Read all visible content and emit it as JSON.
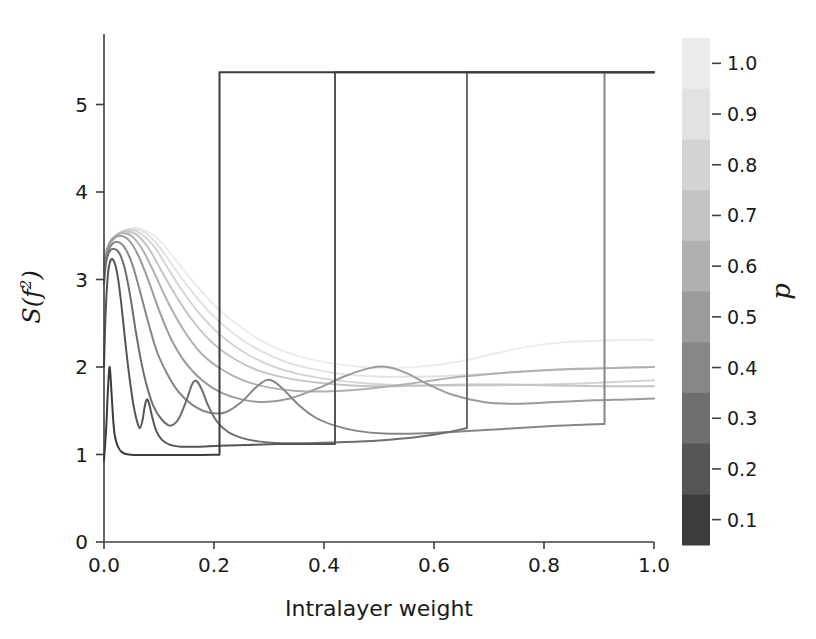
{
  "figure": {
    "background": "#ffffff",
    "axis_color": "#3f3f3f",
    "text_color": "#1a1a1a"
  },
  "chart_data": {
    "type": "line",
    "title": "",
    "xlabel": "Intralayer weight",
    "ylabel": "S(f²)",
    "ylabel_parts": {
      "main": "S(f",
      "sup": "2",
      "tail": ")"
    },
    "xlim": [
      0.0,
      1.0
    ],
    "ylim": [
      0.0,
      5.6
    ],
    "xticks": [
      0.0,
      0.2,
      0.4,
      0.6,
      0.8,
      1.0
    ],
    "xticklabels": [
      "0.0",
      "0.2",
      "0.4",
      "0.6",
      "0.8",
      "1.0"
    ],
    "yticks": [
      0,
      1,
      2,
      3,
      4,
      5
    ],
    "yticklabels": [
      "0",
      "1",
      "2",
      "3",
      "4",
      "5"
    ],
    "grid": false,
    "legend": "colorbar-right",
    "plateau_value": 5.37,
    "series": [
      {
        "name": "p = 0.1",
        "p": 0.1,
        "color": "#3c3c3c",
        "linewidth": 2.0,
        "points": [
          [
            0.0,
            0.93
          ],
          [
            0.004,
            1.3
          ],
          [
            0.007,
            1.72
          ],
          [
            0.01,
            2.0
          ],
          [
            0.013,
            1.78
          ],
          [
            0.016,
            1.46
          ],
          [
            0.019,
            1.24
          ],
          [
            0.023,
            1.13
          ],
          [
            0.027,
            1.07
          ],
          [
            0.032,
            1.03
          ],
          [
            0.04,
            1.005
          ],
          [
            0.055,
            0.995
          ],
          [
            0.07,
            0.993
          ],
          [
            0.09,
            0.993
          ],
          [
            0.12,
            0.994
          ],
          [
            0.16,
            0.995
          ],
          [
            0.2,
            0.997
          ],
          [
            0.209,
            0.998
          ]
        ],
        "jump_x": 0.21,
        "jump_to": 5.37,
        "plateau_to_x": 1.0
      },
      {
        "name": "p = 0.2",
        "p": 0.2,
        "color": "#555555",
        "linewidth": 2.0,
        "points": [
          [
            0.0,
            2.0
          ],
          [
            0.003,
            2.62
          ],
          [
            0.007,
            3.05
          ],
          [
            0.012,
            3.22
          ],
          [
            0.018,
            3.21
          ],
          [
            0.024,
            3.07
          ],
          [
            0.03,
            2.8
          ],
          [
            0.036,
            2.45
          ],
          [
            0.042,
            2.1
          ],
          [
            0.048,
            1.8
          ],
          [
            0.054,
            1.55
          ],
          [
            0.06,
            1.38
          ],
          [
            0.065,
            1.3
          ],
          [
            0.07,
            1.39
          ],
          [
            0.074,
            1.55
          ],
          [
            0.078,
            1.63
          ],
          [
            0.082,
            1.58
          ],
          [
            0.088,
            1.42
          ],
          [
            0.095,
            1.27
          ],
          [
            0.105,
            1.17
          ],
          [
            0.12,
            1.11
          ],
          [
            0.14,
            1.09
          ],
          [
            0.17,
            1.09
          ],
          [
            0.21,
            1.1
          ],
          [
            0.26,
            1.11
          ],
          [
            0.32,
            1.12
          ],
          [
            0.38,
            1.12
          ],
          [
            0.418,
            1.12
          ]
        ],
        "jump_x": 0.42,
        "jump_to": 5.37,
        "plateau_to_x": 1.0
      },
      {
        "name": "p = 0.3",
        "p": 0.3,
        "color": "#6e6e6e",
        "linewidth": 2.0,
        "points": [
          [
            0.0,
            2.95
          ],
          [
            0.004,
            3.2
          ],
          [
            0.01,
            3.32
          ],
          [
            0.018,
            3.35
          ],
          [
            0.028,
            3.3
          ],
          [
            0.038,
            3.12
          ],
          [
            0.048,
            2.8
          ],
          [
            0.058,
            2.4
          ],
          [
            0.068,
            2.05
          ],
          [
            0.078,
            1.78
          ],
          [
            0.09,
            1.55
          ],
          [
            0.105,
            1.4
          ],
          [
            0.12,
            1.33
          ],
          [
            0.135,
            1.4
          ],
          [
            0.15,
            1.62
          ],
          [
            0.16,
            1.8
          ],
          [
            0.168,
            1.84
          ],
          [
            0.178,
            1.74
          ],
          [
            0.19,
            1.55
          ],
          [
            0.205,
            1.38
          ],
          [
            0.225,
            1.26
          ],
          [
            0.25,
            1.19
          ],
          [
            0.28,
            1.15
          ],
          [
            0.32,
            1.13
          ],
          [
            0.37,
            1.13
          ],
          [
            0.43,
            1.14
          ],
          [
            0.5,
            1.16
          ],
          [
            0.57,
            1.2
          ],
          [
            0.63,
            1.26
          ],
          [
            0.658,
            1.3
          ]
        ],
        "jump_x": 0.66,
        "jump_to": 5.37,
        "plateau_to_x": 1.0
      },
      {
        "name": "p = 0.4",
        "p": 0.4,
        "color": "#868686",
        "linewidth": 2.0,
        "points": [
          [
            0.0,
            3.1
          ],
          [
            0.006,
            3.3
          ],
          [
            0.014,
            3.4
          ],
          [
            0.024,
            3.43
          ],
          [
            0.036,
            3.38
          ],
          [
            0.05,
            3.2
          ],
          [
            0.064,
            2.9
          ],
          [
            0.08,
            2.52
          ],
          [
            0.096,
            2.18
          ],
          [
            0.115,
            1.92
          ],
          [
            0.135,
            1.72
          ],
          [
            0.16,
            1.57
          ],
          [
            0.19,
            1.48
          ],
          [
            0.22,
            1.48
          ],
          [
            0.25,
            1.6
          ],
          [
            0.275,
            1.76
          ],
          [
            0.295,
            1.85
          ],
          [
            0.31,
            1.83
          ],
          [
            0.33,
            1.72
          ],
          [
            0.355,
            1.56
          ],
          [
            0.385,
            1.42
          ],
          [
            0.42,
            1.33
          ],
          [
            0.46,
            1.27
          ],
          [
            0.51,
            1.24
          ],
          [
            0.57,
            1.24
          ],
          [
            0.64,
            1.26
          ],
          [
            0.72,
            1.29
          ],
          [
            0.8,
            1.32
          ],
          [
            0.87,
            1.34
          ],
          [
            0.908,
            1.35
          ]
        ],
        "jump_x": 0.91,
        "jump_to": 5.37,
        "plateau_to_x": 1.0
      },
      {
        "name": "p = 0.5",
        "p": 0.5,
        "color": "#9b9b9b",
        "linewidth": 2.0,
        "points": [
          [
            0.0,
            3.18
          ],
          [
            0.008,
            3.38
          ],
          [
            0.018,
            3.47
          ],
          [
            0.03,
            3.5
          ],
          [
            0.045,
            3.45
          ],
          [
            0.062,
            3.28
          ],
          [
            0.08,
            3.0
          ],
          [
            0.1,
            2.65
          ],
          [
            0.122,
            2.32
          ],
          [
            0.148,
            2.05
          ],
          [
            0.178,
            1.85
          ],
          [
            0.212,
            1.71
          ],
          [
            0.25,
            1.63
          ],
          [
            0.292,
            1.6
          ],
          [
            0.338,
            1.64
          ],
          [
            0.39,
            1.76
          ],
          [
            0.44,
            1.9
          ],
          [
            0.485,
            1.99
          ],
          [
            0.515,
            2.0
          ],
          [
            0.55,
            1.93
          ],
          [
            0.59,
            1.8
          ],
          [
            0.635,
            1.68
          ],
          [
            0.69,
            1.6
          ],
          [
            0.75,
            1.58
          ],
          [
            0.82,
            1.6
          ],
          [
            0.89,
            1.62
          ],
          [
            0.95,
            1.63
          ],
          [
            1.0,
            1.64
          ]
        ],
        "jump_x": null
      },
      {
        "name": "p = 0.6",
        "p": 0.6,
        "color": "#b0b0b0",
        "linewidth": 2.0,
        "points": [
          [
            0.0,
            3.22
          ],
          [
            0.01,
            3.42
          ],
          [
            0.022,
            3.5
          ],
          [
            0.036,
            3.53
          ],
          [
            0.052,
            3.49
          ],
          [
            0.072,
            3.32
          ],
          [
            0.094,
            3.04
          ],
          [
            0.118,
            2.72
          ],
          [
            0.145,
            2.42
          ],
          [
            0.176,
            2.16
          ],
          [
            0.212,
            1.98
          ],
          [
            0.252,
            1.85
          ],
          [
            0.296,
            1.77
          ],
          [
            0.345,
            1.73
          ],
          [
            0.4,
            1.72
          ],
          [
            0.46,
            1.74
          ],
          [
            0.52,
            1.78
          ],
          [
            0.58,
            1.83
          ],
          [
            0.65,
            1.89
          ],
          [
            0.72,
            1.93
          ],
          [
            0.79,
            1.96
          ],
          [
            0.86,
            1.98
          ],
          [
            0.93,
            1.99
          ],
          [
            1.0,
            2.0
          ]
        ],
        "jump_x": null
      },
      {
        "name": "p = 0.7",
        "p": 0.7,
        "color": "#c4c4c4",
        "linewidth": 2.0,
        "points": [
          [
            0.0,
            3.25
          ],
          [
            0.012,
            3.44
          ],
          [
            0.026,
            3.52
          ],
          [
            0.042,
            3.55
          ],
          [
            0.06,
            3.51
          ],
          [
            0.082,
            3.35
          ],
          [
            0.106,
            3.08
          ],
          [
            0.134,
            2.78
          ],
          [
            0.165,
            2.5
          ],
          [
            0.2,
            2.26
          ],
          [
            0.24,
            2.08
          ],
          [
            0.285,
            1.95
          ],
          [
            0.335,
            1.87
          ],
          [
            0.39,
            1.82
          ],
          [
            0.45,
            1.79
          ],
          [
            0.515,
            1.78
          ],
          [
            0.585,
            1.79
          ],
          [
            0.66,
            1.8
          ],
          [
            0.735,
            1.8
          ],
          [
            0.82,
            1.79
          ],
          [
            0.91,
            1.78
          ],
          [
            1.0,
            1.78
          ]
        ],
        "jump_x": null
      },
      {
        "name": "p = 0.8",
        "p": 0.8,
        "color": "#d4d4d4",
        "linewidth": 2.0,
        "points": [
          [
            0.0,
            3.27
          ],
          [
            0.014,
            3.46
          ],
          [
            0.03,
            3.54
          ],
          [
            0.048,
            3.57
          ],
          [
            0.068,
            3.52
          ],
          [
            0.092,
            3.37
          ],
          [
            0.118,
            3.11
          ],
          [
            0.148,
            2.82
          ],
          [
            0.182,
            2.55
          ],
          [
            0.22,
            2.32
          ],
          [
            0.262,
            2.14
          ],
          [
            0.31,
            2.0
          ],
          [
            0.362,
            1.91
          ],
          [
            0.42,
            1.85
          ],
          [
            0.485,
            1.81
          ],
          [
            0.555,
            1.79
          ],
          [
            0.63,
            1.79
          ],
          [
            0.71,
            1.79
          ],
          [
            0.8,
            1.8
          ],
          [
            0.9,
            1.82
          ],
          [
            1.0,
            1.85
          ]
        ],
        "jump_x": null
      },
      {
        "name": "p = 0.9",
        "p": 0.9,
        "color": "#e2e2e2",
        "linewidth": 2.0,
        "points": [
          [
            0.0,
            3.28
          ],
          [
            0.016,
            3.47
          ],
          [
            0.034,
            3.55
          ],
          [
            0.054,
            3.58
          ],
          [
            0.076,
            3.53
          ],
          [
            0.1,
            3.38
          ],
          [
            0.128,
            3.13
          ],
          [
            0.16,
            2.86
          ],
          [
            0.196,
            2.6
          ],
          [
            0.236,
            2.38
          ],
          [
            0.28,
            2.2
          ],
          [
            0.33,
            2.06
          ],
          [
            0.385,
            1.97
          ],
          [
            0.445,
            1.91
          ],
          [
            0.51,
            1.89
          ],
          [
            0.58,
            1.89
          ],
          [
            0.66,
            1.91
          ],
          [
            0.745,
            1.94
          ],
          [
            0.835,
            1.97
          ],
          [
            0.92,
            1.99
          ],
          [
            1.0,
            2.0
          ]
        ],
        "jump_x": null
      },
      {
        "name": "p = 1.0",
        "p": 1.0,
        "color": "#ececec",
        "linewidth": 2.0,
        "points": [
          [
            0.0,
            3.3
          ],
          [
            0.018,
            3.48
          ],
          [
            0.038,
            3.56
          ],
          [
            0.058,
            3.59
          ],
          [
            0.082,
            3.54
          ],
          [
            0.108,
            3.4
          ],
          [
            0.138,
            3.16
          ],
          [
            0.172,
            2.9
          ],
          [
            0.21,
            2.65
          ],
          [
            0.252,
            2.44
          ],
          [
            0.298,
            2.26
          ],
          [
            0.35,
            2.13
          ],
          [
            0.406,
            2.05
          ],
          [
            0.468,
            2.0
          ],
          [
            0.535,
            1.99
          ],
          [
            0.6,
            2.02
          ],
          [
            0.66,
            2.08
          ],
          [
            0.715,
            2.16
          ],
          [
            0.77,
            2.23
          ],
          [
            0.83,
            2.28
          ],
          [
            0.9,
            2.3
          ],
          [
            0.96,
            2.31
          ],
          [
            1.0,
            2.31
          ]
        ],
        "jump_x": null
      }
    ]
  },
  "colorbar": {
    "title": "p",
    "orientation": "vertical",
    "vmin": 0.05,
    "vmax": 1.05,
    "ticks": [
      1.0,
      0.9,
      0.8,
      0.7,
      0.6,
      0.5,
      0.4,
      0.3,
      0.2,
      0.1
    ],
    "ticklabels": [
      "1.0",
      "0.9",
      "0.8",
      "0.7",
      "0.6",
      "0.5",
      "0.4",
      "0.3",
      "0.2",
      "0.1"
    ],
    "bands": [
      {
        "value": 1.0,
        "color": "#ececec"
      },
      {
        "value": 0.9,
        "color": "#e2e2e2"
      },
      {
        "value": 0.8,
        "color": "#d4d4d4"
      },
      {
        "value": 0.7,
        "color": "#c4c4c4"
      },
      {
        "value": 0.6,
        "color": "#b0b0b0"
      },
      {
        "value": 0.5,
        "color": "#9b9b9b"
      },
      {
        "value": 0.4,
        "color": "#868686"
      },
      {
        "value": 0.3,
        "color": "#6e6e6e"
      },
      {
        "value": 0.2,
        "color": "#555555"
      },
      {
        "value": 0.1,
        "color": "#3c3c3c"
      }
    ]
  }
}
